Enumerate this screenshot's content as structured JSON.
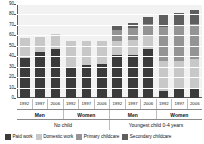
{
  "chart_data": {
    "type": "bar",
    "stacked": true,
    "title": "",
    "subtitle": "",
    "xlabel": "",
    "ylabel": "",
    "ylim": [
      0,
      90
    ],
    "ytick_step": 10,
    "yticks": [
      90,
      80,
      70,
      60,
      50,
      40,
      30,
      20,
      10,
      0
    ],
    "grid": true,
    "legend_position": "bottom",
    "categories": [
      "1992",
      "1997",
      "2006",
      "1992",
      "1997",
      "2006",
      "1992",
      "1997",
      "2006",
      "1992",
      "1997",
      "2006"
    ],
    "group_level_1": [
      "Men",
      "Women",
      "Men",
      "Women"
    ],
    "group_level_2": [
      "No child",
      "Youngest child 0-4 years"
    ],
    "series": [
      {
        "name": "Paid work",
        "color": "#3b3b3b",
        "values": [
          38,
          44,
          47,
          30,
          32,
          33,
          41,
          41,
          47,
          7,
          9,
          10
        ]
      },
      {
        "name": "Domestic work",
        "color": "#c8c8c8",
        "values": [
          19,
          14,
          14,
          25,
          23,
          22,
          14,
          15,
          12,
          28,
          26,
          27
        ]
      },
      {
        "name": "Primary childcare",
        "color": "#949494",
        "values": [
          0,
          0,
          0,
          0,
          0,
          0,
          10,
          11,
          12,
          33,
          34,
          34
        ]
      },
      {
        "name": "Secondary childcare",
        "color": "#5e5e5e",
        "values": [
          0,
          0,
          0,
          0,
          0,
          0,
          5,
          5,
          7,
          12,
          12,
          13
        ]
      }
    ],
    "totals": [
      57,
      58,
      61,
      55,
      55,
      55,
      70,
      72,
      78,
      80,
      81,
      84
    ]
  },
  "legend": {
    "items": [
      {
        "label": "Paid work",
        "color": "#3b3b3b"
      },
      {
        "label": "Domestic work",
        "color": "#c8c8c8"
      },
      {
        "label": "Primary childcare",
        "color": "#949494"
      },
      {
        "label": "Secondary childcare",
        "color": "#5e5e5e"
      }
    ]
  },
  "colors": {
    "plot_background": "#f2f2f2",
    "gridline": "#ffffff",
    "axis": "#5a5a5a",
    "text": "#111111"
  }
}
